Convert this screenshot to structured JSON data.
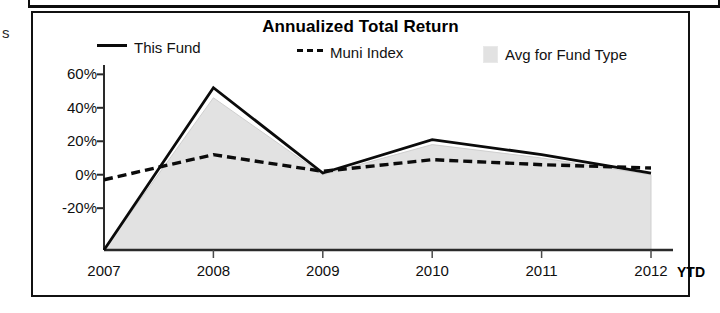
{
  "scan_fragment": "s",
  "chart": {
    "title": "Annualized Total Return",
    "legend": [
      {
        "key": "this-fund",
        "label": "This Fund",
        "marker": "solid-line",
        "color": "#0b0b0b"
      },
      {
        "key": "muni-index",
        "label": "Muni Index",
        "marker": "dashed-line",
        "color": "#0b0b0b"
      },
      {
        "key": "avg-fund-type",
        "label": "Avg for Fund Type",
        "marker": "filled-area",
        "color": "#e2e2e2"
      }
    ],
    "ytd_note": "YTD"
  },
  "chart_data": {
    "type": "line",
    "title": "Annualized Total Return",
    "xlabel": "",
    "ylabel": "",
    "categories": [
      "2007",
      "2008",
      "2009",
      "2010",
      "2011",
      "2012"
    ],
    "x_tick_labels": [
      "2007",
      "2008",
      "2009",
      "2010",
      "2011",
      "2012"
    ],
    "y_tick_labels": [
      "60%",
      "40%",
      "20%",
      "0%",
      "-20%"
    ],
    "y_ticks": [
      60,
      40,
      20,
      0,
      -20
    ],
    "ylim": [
      -45,
      62
    ],
    "grid": false,
    "legend_position": "top",
    "annotations": [
      "YTD"
    ],
    "series": [
      {
        "name": "This Fund",
        "style": "solid",
        "color": "#0b0b0b",
        "values": [
          -45,
          52,
          1,
          21,
          12,
          1
        ]
      },
      {
        "name": "Muni Index",
        "style": "dashed",
        "color": "#0b0b0b",
        "values": [
          -3,
          12,
          2,
          9,
          6,
          4
        ]
      },
      {
        "name": "Avg for Fund Type",
        "style": "filled-area",
        "color": "#e2e2e2",
        "values": [
          -45,
          46,
          0,
          18,
          10,
          0
        ]
      }
    ]
  }
}
